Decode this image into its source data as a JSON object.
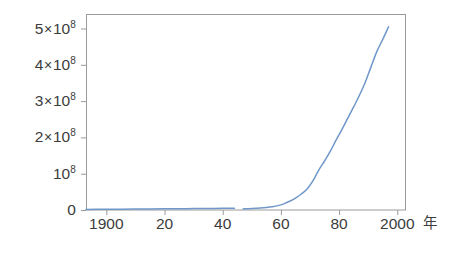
{
  "chart_data": {
    "type": "line",
    "title": "",
    "subtitle": "",
    "xlabel": "年",
    "ylabel": "",
    "xlim": [
      1893,
      2003
    ],
    "ylim": [
      0,
      540000000
    ],
    "grid": false,
    "legend": null,
    "line_color": "#6f97c9",
    "frame_color": "#9a9a9a",
    "background": "#ffffff",
    "x_ticks": [
      1900,
      1920,
      1940,
      1960,
      1980,
      2000
    ],
    "x_tick_labels": [
      "1900",
      "20",
      "40",
      "60",
      "80",
      "2000"
    ],
    "x_minor_ticks": [
      1880,
      2000
    ],
    "y_ticks": [
      0,
      100000000,
      200000000,
      300000000,
      400000000,
      500000000
    ],
    "y_tick_labels": [
      "0",
      "10^8",
      "2×10^8",
      "3×10^8",
      "4×10^8",
      "5×10^8"
    ],
    "y_tick_parts": [
      {
        "coef": "0",
        "times": "",
        "base": "",
        "exp": ""
      },
      {
        "coef": "",
        "times": "",
        "base": "10",
        "exp": "8"
      },
      {
        "coef": "2",
        "times": "×",
        "base": "10",
        "exp": "8"
      },
      {
        "coef": "3",
        "times": "×",
        "base": "10",
        "exp": "8"
      },
      {
        "coef": "4",
        "times": "×",
        "base": "10",
        "exp": "8"
      },
      {
        "coef": "5",
        "times": "×",
        "base": "10",
        "exp": "8"
      }
    ],
    "series": [
      {
        "name": "value",
        "break_after_x": 1944,
        "resume_at_x": 1947,
        "x": [
          1893,
          1900,
          1905,
          1910,
          1915,
          1920,
          1925,
          1930,
          1935,
          1940,
          1944,
          1947,
          1950,
          1953,
          1955,
          1957,
          1959,
          1961,
          1963,
          1965,
          1967,
          1969,
          1971,
          1973,
          1975,
          1977,
          1979,
          1981,
          1983,
          1985,
          1987,
          1989,
          1991,
          1993,
          1995,
          1997
        ],
        "y": [
          1500000,
          2000000,
          2300000,
          2600000,
          2900000,
          3200000,
          3500000,
          3800000,
          4200000,
          4600000,
          5000000,
          3000000,
          4000000,
          5500000,
          7000000,
          9000000,
          12000000,
          17000000,
          24000000,
          33000000,
          44000000,
          58000000,
          80000000,
          110000000,
          135000000,
          162000000,
          193000000,
          222000000,
          253000000,
          284000000,
          316000000,
          352000000,
          395000000,
          437000000,
          470000000,
          505000000
        ]
      }
    ]
  },
  "axes": {
    "frame": {
      "left": 86,
      "top": 14,
      "right": 406,
      "bottom": 210
    }
  }
}
